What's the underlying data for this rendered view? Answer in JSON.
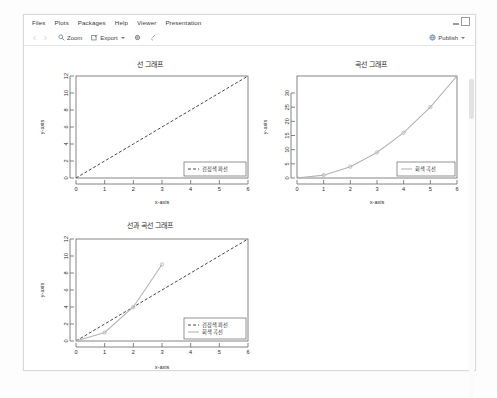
{
  "window": {
    "menu": [
      {
        "label": "Files"
      },
      {
        "label": "Plots"
      },
      {
        "label": "Packages"
      },
      {
        "label": "Help"
      },
      {
        "label": "Viewer"
      },
      {
        "label": "Presentation"
      }
    ],
    "toolbar": {
      "zoom_label": "Zoom",
      "export_label": "Export",
      "publish_label": "Publish"
    }
  },
  "chart_data": [
    {
      "type": "line",
      "title": "선 그래프",
      "xlabel": "x-axis",
      "ylabel": "y-axis",
      "xlim": [
        0,
        6
      ],
      "ylim": [
        0,
        12
      ],
      "xticks": [
        0,
        1,
        2,
        3,
        4,
        5,
        6
      ],
      "yticks": [
        0,
        2,
        4,
        6,
        8,
        10,
        12
      ],
      "grid": false,
      "legend_position": "bottom-right",
      "series": [
        {
          "name": "검정색 파선",
          "style": "dashed",
          "color": "#333333",
          "markers": false,
          "x": [
            0,
            1,
            2,
            3,
            4,
            5,
            6
          ],
          "values": [
            0,
            2,
            4,
            6,
            8,
            10,
            12
          ]
        }
      ]
    },
    {
      "type": "line",
      "title": "곡선 그래프",
      "xlabel": "x-axis",
      "ylabel": "y-axis",
      "xlim": [
        0,
        6
      ],
      "ylim": [
        0,
        36
      ],
      "xticks": [
        0,
        1,
        2,
        3,
        4,
        5,
        6
      ],
      "yticks": [
        0,
        5,
        10,
        15,
        20,
        25,
        30
      ],
      "grid": false,
      "legend_position": "bottom-right",
      "series": [
        {
          "name": "회색 곡선",
          "style": "solid",
          "color": "#b4b4b4",
          "markers": true,
          "x": [
            0,
            1,
            2,
            3,
            4,
            5,
            6
          ],
          "values": [
            0,
            1,
            4,
            9,
            16,
            25,
            36
          ]
        }
      ]
    },
    {
      "type": "line",
      "title": "선과 곡선 그래프",
      "xlabel": "x-axis",
      "ylabel": "y-axis",
      "xlim": [
        0,
        6
      ],
      "ylim": [
        0,
        12
      ],
      "xticks": [
        0,
        1,
        2,
        3,
        4,
        5,
        6
      ],
      "yticks": [
        0,
        2,
        4,
        6,
        8,
        10,
        12
      ],
      "grid": false,
      "legend_position": "bottom-right",
      "series": [
        {
          "name": "검정색 파선",
          "style": "dashed",
          "color": "#333333",
          "markers": false,
          "x": [
            0,
            1,
            2,
            3,
            4,
            5,
            6
          ],
          "values": [
            0,
            2,
            4,
            6,
            8,
            10,
            12
          ]
        },
        {
          "name": "회색 곡선",
          "style": "solid",
          "color": "#b4b4b4",
          "markers": true,
          "x": [
            0,
            1,
            2,
            3
          ],
          "values": [
            0,
            1,
            4,
            9
          ]
        }
      ]
    }
  ]
}
